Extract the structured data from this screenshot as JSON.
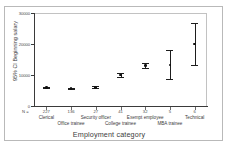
{
  "chart_data": {
    "type": "scatter",
    "title": "",
    "subtitle": "",
    "xlabel": "Employment category",
    "ylabel": "95% CI Beginning salary",
    "ylim": [
      0,
      30000
    ],
    "yticks": [
      0,
      10000,
      20000,
      30000
    ],
    "ytick_labels": [
      "0",
      "10000",
      "20000",
      "30000"
    ],
    "grid": false,
    "legend": "none",
    "error_bar_type": "95% confidence interval",
    "n_prefix_label": "N =",
    "categories": [
      "Clerical",
      "Office trainee",
      "Security officer",
      "College trainee",
      "Exempt employee",
      "MBA trainee",
      "Technical"
    ],
    "n_values": [
      "227",
      "136",
      "27",
      "41",
      "32",
      "5",
      "6"
    ],
    "means": [
      6031,
      5733,
      6031,
      9956,
      13019,
      13258,
      19996
    ],
    "ci_lower": [
      5790,
      5520,
      5730,
      9270,
      12180,
      8570,
      13200
    ],
    "ci_upper": [
      6280,
      5950,
      6330,
      10640,
      13860,
      17950,
      26780
    ],
    "points": [
      {
        "category": "Clerical",
        "n": "227",
        "mean": 6031,
        "ci_lower": 5790,
        "ci_upper": 6280
      },
      {
        "category": "Office trainee",
        "n": "136",
        "mean": 5733,
        "ci_lower": 5520,
        "ci_upper": 5950
      },
      {
        "category": "Security officer",
        "n": "27",
        "mean": 6031,
        "ci_lower": 5730,
        "ci_upper": 6330
      },
      {
        "category": "College trainee",
        "n": "41",
        "mean": 9956,
        "ci_lower": 9270,
        "ci_upper": 10640
      },
      {
        "category": "Exempt employee",
        "n": "32",
        "mean": 13019,
        "ci_lower": 12180,
        "ci_upper": 13860
      },
      {
        "category": "MBA trainee",
        "n": "5",
        "mean": 13258,
        "ci_lower": 8570,
        "ci_upper": 17950
      },
      {
        "category": "Technical",
        "n": "6",
        "mean": 19996,
        "ci_lower": 13200,
        "ci_upper": 26780
      }
    ]
  }
}
